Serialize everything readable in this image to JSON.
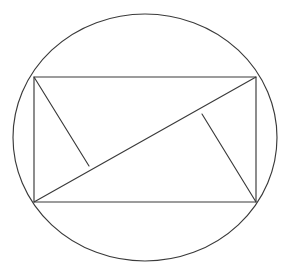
{
  "figure": {
    "background_color": "#ffffff",
    "stroke_color": "#3a3a3a",
    "stroke_width": 1.15,
    "canvas": {
      "width": 290,
      "height": 278
    }
  },
  "chart_data": {
    "type": "diagram",
    "xlabel": "",
    "ylabel": "",
    "xlim": [
      0,
      290
    ],
    "ylim": [
      0,
      278
    ],
    "grid": false,
    "legend": null,
    "annotations": [],
    "shapes": [
      {
        "name": "circumscribed-circle",
        "type": "ellipse",
        "cx": 145,
        "cy": 137.5,
        "rx": 132,
        "ry": 123.5
      },
      {
        "name": "inscribed-rectangle",
        "type": "polygon",
        "closed": true,
        "points": [
          [
            34,
            77
          ],
          [
            256,
            77
          ],
          [
            256,
            202
          ],
          [
            34,
            202
          ]
        ]
      },
      {
        "name": "rectangle-diagonal",
        "type": "line",
        "points": [
          [
            34,
            202
          ],
          [
            256,
            77
          ]
        ]
      },
      {
        "name": "altitude-from-top-left",
        "type": "line",
        "points": [
          [
            34,
            77
          ],
          [
            89,
            166
          ]
        ]
      },
      {
        "name": "altitude-from-bottom-right",
        "type": "line",
        "points": [
          [
            256,
            202
          ],
          [
            202,
            114
          ]
        ]
      }
    ],
    "vertices": {
      "top_left": [
        34,
        77
      ],
      "top_right": [
        256,
        77
      ],
      "bottom_right": [
        256,
        202
      ],
      "bottom_left": [
        34,
        202
      ],
      "foot_of_altitude_left": [
        89,
        166
      ],
      "foot_of_altitude_right": [
        202,
        114
      ]
    }
  }
}
